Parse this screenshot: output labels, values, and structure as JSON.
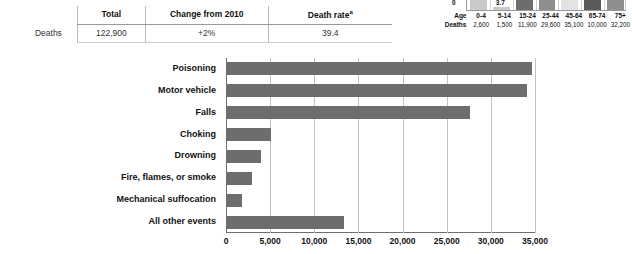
{
  "summary": {
    "row_label": "Deaths",
    "headers": {
      "total": "Total",
      "change": "Change from 2010",
      "death_rate": "Death rate",
      "death_rate_superscript": "a"
    },
    "values": {
      "total": "122,900",
      "change": "+2%",
      "death_rate": "39.4"
    }
  },
  "mini_chart_labels": {
    "zero": "0",
    "age_row_label": "Age",
    "deaths_row_label": "Deaths"
  },
  "chart_data": [
    {
      "type": "bar",
      "title": "Deaths by age group",
      "xlabel": "Age",
      "ylabel": "Death rate",
      "categories": [
        "0-4",
        "5-14",
        "15-24",
        "25-44",
        "45-64",
        "65-74",
        "75+"
      ],
      "values": [
        12.9,
        3.7,
        27.2,
        32.0,
        42.0,
        55.0,
        60.0
      ],
      "value_labels": [
        "12.9",
        "3.7",
        "27.2",
        "",
        "",
        "",
        ""
      ],
      "deaths": [
        "2,600",
        "1,500",
        "11,900",
        "29,600",
        "35,100",
        "10,000",
        "32,200"
      ],
      "bar_colors": [
        "#c9c9c9",
        "#c9c9c9",
        "#6d6d6d",
        "#8e8e8e",
        "#e3e3e3",
        "#5a5a5a",
        "#8e8e8e"
      ],
      "grid": false,
      "legend": "none",
      "note": "bars are clipped at the top edge of the screenshot"
    },
    {
      "type": "bar",
      "orientation": "horizontal",
      "title": "",
      "xlabel": "",
      "ylabel": "",
      "categories": [
        "Poisoning",
        "Motor vehicle",
        "Falls",
        "Choking",
        "Drowning",
        "Fire, flames, or smoke",
        "Mechanical suffocation",
        "All other events"
      ],
      "values": [
        34500,
        34000,
        27500,
        5000,
        3900,
        2800,
        1700,
        13300
      ],
      "xlim": [
        0,
        35000
      ],
      "xticks": [
        0,
        5000,
        10000,
        15000,
        20000,
        25000,
        30000,
        35000
      ],
      "xtick_labels": [
        "0",
        "5,000",
        "10,000",
        "15,000",
        "20,000",
        "25,000",
        "30,000",
        "35,000"
      ],
      "bar_color": "#6d6d6d",
      "grid": true,
      "legend": "none"
    }
  ]
}
